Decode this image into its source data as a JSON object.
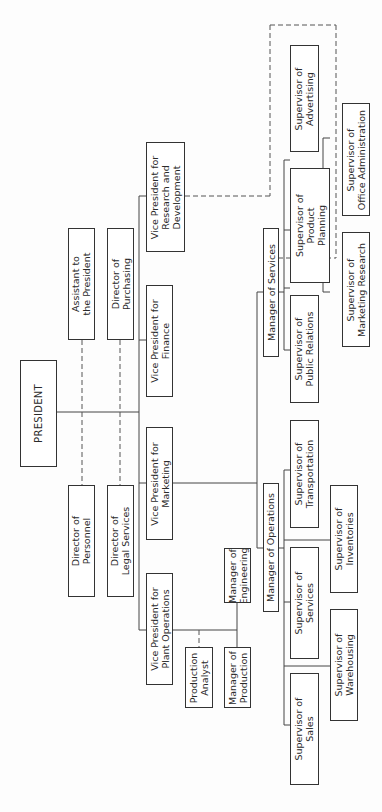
{
  "chart": {
    "orientation": "rotated-90-ccw",
    "president": "PRESIDENT",
    "staff": {
      "assistant": "Assistant to\nthe President",
      "purchasing": "Director of\nPurchasing",
      "personnel": "Director of\nPersonnel",
      "legal": "Director of\nLegal Services"
    },
    "vps": {
      "rnd": "Vice President for\nResearch and\nDevelopment",
      "finance": "Vice President for\nFinance",
      "marketing": "Vice President for\nMarketing",
      "plant": "Vice President for\nPlant Operations"
    },
    "managers": {
      "services": "Manager of Services",
      "operations": "Manager of Operations",
      "engineering": "Manager of\nEngineering",
      "production": "Manager of\nProduction",
      "analyst": "Production\nAnalyst"
    },
    "supervisors": {
      "advertising": "Supervisor of\nAdvertising",
      "office_admin": "Supervisor of\nOffice Administration",
      "product_planning": "Supervisor of\nProduct\nPlanning",
      "marketing_research": "Supervisor of\nMarketing Research",
      "public_relations": "Supervisor of\nPublic Relations",
      "transportation": "Supervisor of\nTransportation",
      "inventories": "Supervisor of\nInventories",
      "services": "Supervisor of\nServices",
      "warehousing": "Supervisor of\nWarehousing",
      "sales": "Supervisor of\nSales"
    }
  },
  "colors": {
    "line": "#444444",
    "dashed": "#555555",
    "background": "#fdfdfd"
  }
}
